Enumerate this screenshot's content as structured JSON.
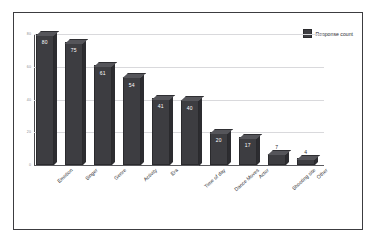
{
  "chart_data": {
    "type": "bar",
    "title": "",
    "subtitle": "",
    "xlabel": "",
    "ylabel": "",
    "categories": [
      "Emotion",
      "Singer",
      "Genre",
      "Activity",
      "Era",
      "Time of day",
      "Dance Moves",
      "Actor",
      "Shooting site",
      "Other"
    ],
    "values": [
      80,
      75,
      61,
      54,
      41,
      40,
      20,
      17,
      7,
      4
    ],
    "series": [
      {
        "name": "Response count",
        "values": [
          80,
          75,
          61,
          54,
          41,
          40,
          20,
          17,
          7,
          4
        ]
      }
    ],
    "ylim": [
      0,
      80
    ],
    "yticks": [
      80,
      60,
      40,
      20,
      0
    ],
    "ytick_labels": [
      "80",
      "60",
      "40",
      "20",
      "0"
    ],
    "grid": true,
    "legend_position": "top-right",
    "bar_labels_shown": true,
    "bar_style": "3d"
  },
  "legend": {
    "entries": [
      {
        "label": "Response count",
        "color": "#3d3d41"
      }
    ]
  },
  "colors": {
    "bar_front": "#3d3d41",
    "bar_top": "#55555a",
    "bar_side": "#2c2c30",
    "gridline": "#d9d9dc",
    "axis": "#4a4a4e",
    "frame_border": "#3c3c40",
    "background": "#ffffff",
    "label_text": "#2e2e32",
    "tick_text": "#8a8a8e",
    "value_text_inside": "#ffffff"
  }
}
